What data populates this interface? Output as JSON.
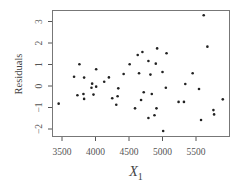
{
  "chart_data": {
    "type": "scatter",
    "title": "",
    "xlabel": "X",
    "xlabel_subscript": "1",
    "ylabel": "Residuals",
    "xlim": [
      3380,
      5940
    ],
    "ylim": [
      -2.3,
      3.5
    ],
    "xticks": [
      3500,
      4000,
      4500,
      5000,
      5500
    ],
    "yticks": [
      -2,
      -1,
      0,
      1,
      2,
      3
    ],
    "grid": false,
    "legend": null,
    "points": [
      {
        "x": 3450,
        "y": -0.82
      },
      {
        "x": 3680,
        "y": 0.43
      },
      {
        "x": 3760,
        "y": 1.01
      },
      {
        "x": 3730,
        "y": -0.43
      },
      {
        "x": 3830,
        "y": 0.39
      },
      {
        "x": 3820,
        "y": -0.37
      },
      {
        "x": 3830,
        "y": -0.6
      },
      {
        "x": 3950,
        "y": 0.11
      },
      {
        "x": 3940,
        "y": -0.08
      },
      {
        "x": 3970,
        "y": -0.4
      },
      {
        "x": 4010,
        "y": 0.78
      },
      {
        "x": 4010,
        "y": -0.03
      },
      {
        "x": 4130,
        "y": 0.2
      },
      {
        "x": 4200,
        "y": 0.4
      },
      {
        "x": 4250,
        "y": -0.57
      },
      {
        "x": 4310,
        "y": -0.87
      },
      {
        "x": 4330,
        "y": -0.48
      },
      {
        "x": 4340,
        "y": -0.11
      },
      {
        "x": 4420,
        "y": 0.56
      },
      {
        "x": 4510,
        "y": 1.01
      },
      {
        "x": 4590,
        "y": -1.04
      },
      {
        "x": 4630,
        "y": 1.44
      },
      {
        "x": 4650,
        "y": 0.59
      },
      {
        "x": 4680,
        "y": -0.65
      },
      {
        "x": 4700,
        "y": 1.58
      },
      {
        "x": 4720,
        "y": -0.29
      },
      {
        "x": 4790,
        "y": 1.16
      },
      {
        "x": 4790,
        "y": -1.49
      },
      {
        "x": 4820,
        "y": 0.53
      },
      {
        "x": 4840,
        "y": -0.37
      },
      {
        "x": 4880,
        "y": -1.36
      },
      {
        "x": 4900,
        "y": 1.04
      },
      {
        "x": 4920,
        "y": 1.75
      },
      {
        "x": 4910,
        "y": -1.04
      },
      {
        "x": 5000,
        "y": 0.65
      },
      {
        "x": 5010,
        "y": -2.09
      },
      {
        "x": 5050,
        "y": -0.08
      },
      {
        "x": 5060,
        "y": 1.52
      },
      {
        "x": 5240,
        "y": -0.74
      },
      {
        "x": 5320,
        "y": -0.74
      },
      {
        "x": 5340,
        "y": 0.09
      },
      {
        "x": 5450,
        "y": 0.59
      },
      {
        "x": 5545,
        "y": -0.14
      },
      {
        "x": 5575,
        "y": -1.58
      },
      {
        "x": 5615,
        "y": 3.29
      },
      {
        "x": 5670,
        "y": 1.83
      },
      {
        "x": 5760,
        "y": -1.12
      },
      {
        "x": 5770,
        "y": -1.32
      },
      {
        "x": 5900,
        "y": -0.62
      }
    ]
  },
  "style": {
    "frame_color": "#777777",
    "point_color": "#222222",
    "tick_color": "#555555"
  }
}
